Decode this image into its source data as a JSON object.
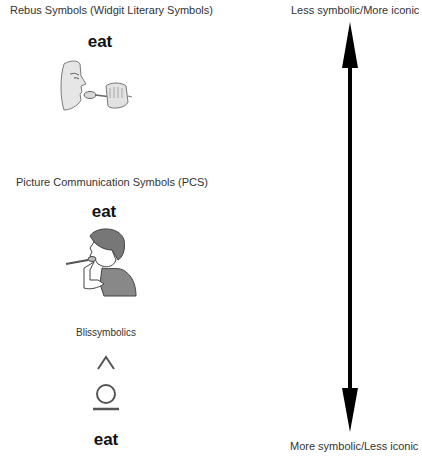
{
  "sections": [
    {
      "title": "Rebus Symbols (Widgit Literary Symbols)",
      "word": "eat",
      "icon": "face-eating-with-spoon-icon"
    },
    {
      "title": "Picture Communication Symbols (PCS)",
      "word": "eat",
      "icon": "boy-eating-with-spoon-icon"
    },
    {
      "title": "Blissymbolics",
      "word": "eat",
      "icon": "bliss-eat-symbol-icon"
    }
  ],
  "scale": {
    "top_label": "Less symbolic/More iconic",
    "bottom_label": "More symbolic/Less iconic",
    "arrow": "double-headed-vertical-arrow",
    "color": "#000000"
  }
}
